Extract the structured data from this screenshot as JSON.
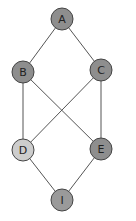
{
  "diagram": {
    "type": "graph",
    "nodes": [
      {
        "id": "A",
        "label": "A",
        "x": 62,
        "y": 19,
        "fill": "#8e8e8e"
      },
      {
        "id": "B",
        "label": "B",
        "x": 23,
        "y": 72,
        "fill": "#8e8e8e"
      },
      {
        "id": "C",
        "label": "C",
        "x": 101,
        "y": 70,
        "fill": "#8e8e8e"
      },
      {
        "id": "D",
        "label": "D",
        "x": 23,
        "y": 150,
        "fill": "#cdcdcd"
      },
      {
        "id": "E",
        "label": "E",
        "x": 101,
        "y": 149,
        "fill": "#8e8e8e"
      },
      {
        "id": "I",
        "label": "I",
        "x": 62,
        "y": 200,
        "fill": "#9a9a9a"
      }
    ],
    "edges": [
      [
        "A",
        "B"
      ],
      [
        "A",
        "C"
      ],
      [
        "B",
        "D"
      ],
      [
        "B",
        "E"
      ],
      [
        "C",
        "D"
      ],
      [
        "C",
        "E"
      ],
      [
        "D",
        "I"
      ],
      [
        "E",
        "I"
      ]
    ]
  }
}
